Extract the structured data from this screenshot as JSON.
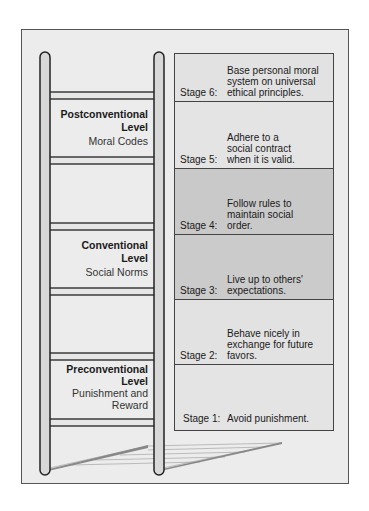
{
  "diagram": {
    "type": "ladder",
    "colors": {
      "background": "#ececec",
      "stage_light": "#e2e2e2",
      "stage_dark": "#c9c9c9",
      "outline": "#222222",
      "rail_fill": "#d8d8d8",
      "rung_fill": "#e6e6e6"
    }
  },
  "levels": [
    {
      "title": "Postconventional",
      "title2": "Level",
      "subtitle": "Moral Codes",
      "subtitle2": ""
    },
    {
      "title": "Conventional",
      "title2": "Level",
      "subtitle": "Social Norms",
      "subtitle2": ""
    },
    {
      "title": "Preconventional",
      "title2": "Level",
      "subtitle": "Punishment and",
      "subtitle2": "Reward"
    }
  ],
  "stages": [
    {
      "label": "Stage 6:",
      "description": "Base personal moral system on universal ethical principles.",
      "shade": "light"
    },
    {
      "label": "Stage 5:",
      "description": "Adhere to a social contract when it is valid.",
      "shade": "light"
    },
    {
      "label": "Stage 4:",
      "description": "Follow rules to maintain social order.",
      "shade": "dark"
    },
    {
      "label": "Stage 3:",
      "description": "Live up to others' expectations.",
      "shade": "dark"
    },
    {
      "label": "Stage 2:",
      "description": "Behave nicely in exchange for future favors.",
      "shade": "light"
    },
    {
      "label": "Stage 1:",
      "description": "Avoid punishment.",
      "shade": "light"
    }
  ]
}
